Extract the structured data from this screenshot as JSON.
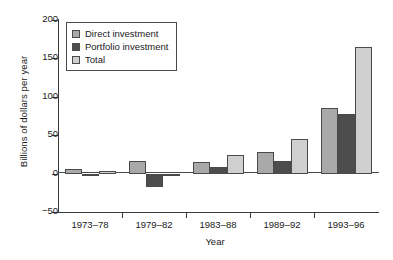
{
  "chart_data": {
    "type": "bar",
    "title": "",
    "xlabel": "Year",
    "ylabel": "Billions of dollars per year",
    "categories": [
      "1973–78",
      "1979–82",
      "1983–88",
      "1989–92",
      "1993–96"
    ],
    "series": [
      {
        "name": "Direct investment",
        "color": "#a9a9a9",
        "values": [
          6,
          17,
          15,
          28,
          86
        ]
      },
      {
        "name": "Portfolio investment",
        "color": "#4d4d4d",
        "values": [
          -3,
          -18,
          9,
          17,
          78
        ]
      },
      {
        "name": "Total",
        "color": "#cfcfcf",
        "values": [
          3,
          -2,
          24,
          45,
          165
        ]
      }
    ],
    "ylim": [
      -50,
      200
    ],
    "yticks": [
      200,
      150,
      100,
      50,
      0,
      -50
    ],
    "ytick_labels": [
      "200",
      "150",
      "100",
      "50",
      "0",
      "−50"
    ],
    "grid": false,
    "legend_position": "upper left"
  }
}
